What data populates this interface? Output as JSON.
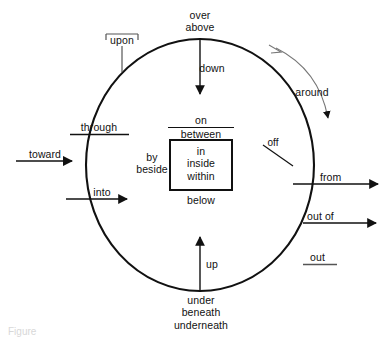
{
  "diagram": {
    "caption": "Figure",
    "stroke_color": "#111111",
    "text_color": "#111111",
    "background_color": "#ffffff",
    "shapes": {
      "circle_label": "boundary-circle",
      "box_label": "inner-box"
    },
    "labels": {
      "over": "over",
      "above": "above",
      "down": "down",
      "upon": "upon",
      "around": "around",
      "through": "through",
      "toward": "toward",
      "into": "into",
      "on": "on",
      "between": "between",
      "by": "by",
      "beside": "beside",
      "in": "in",
      "inside": "inside",
      "within": "within",
      "below": "below",
      "off": "off",
      "from": "from",
      "out_of": "out of",
      "out": "out",
      "up": "up",
      "under": "under",
      "beneath": "beneath",
      "underneath": "underneath"
    }
  }
}
